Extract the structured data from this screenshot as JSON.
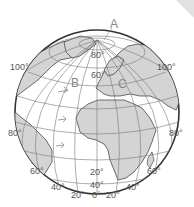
{
  "figure": {
    "type": "globe-diagram",
    "point_labels": {
      "A": "A",
      "B": "B",
      "C": "C"
    },
    "latitude_labels": {
      "n80": "80°",
      "n60": "60°",
      "s20": "20°",
      "s40": "40°"
    },
    "longitude_labels": {
      "w100": "100°",
      "e100": "100°",
      "w80": "80°",
      "e80": "80°",
      "w60": "60°",
      "e60": "60°",
      "w40": "40°",
      "e40": "40°",
      "w20": "20°",
      "zero": "0°",
      "e20": "20°"
    },
    "colors": {
      "land": "#d4d4d4",
      "ocean": "#ffffff",
      "grid": "#777777",
      "outline": "#333333"
    }
  }
}
